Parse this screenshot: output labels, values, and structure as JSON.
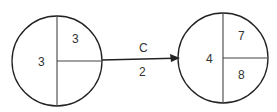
{
  "diagram": {
    "type": "network-node-activity",
    "nodes": [
      {
        "id": "node-left",
        "left_value": "3",
        "top_right_value": "3",
        "bottom_right_value": ""
      },
      {
        "id": "node-right",
        "left_value": "4",
        "top_right_value": "7",
        "bottom_right_value": "8"
      }
    ],
    "edges": [
      {
        "from": "node-left",
        "to": "node-right",
        "activity": "C",
        "duration": "2"
      }
    ],
    "colors": {
      "stroke": "#222222",
      "text": "#333333",
      "background": "#ffffff"
    }
  }
}
